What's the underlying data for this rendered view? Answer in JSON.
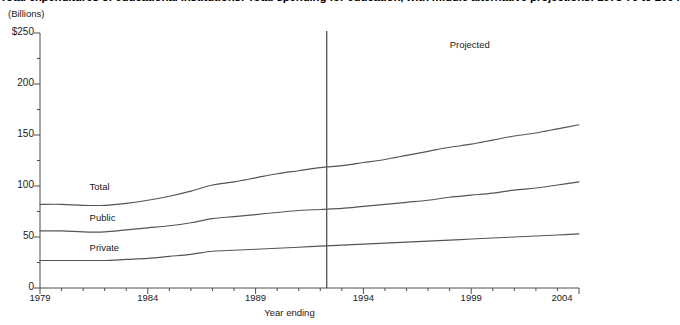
{
  "chart_data": {
    "type": "line",
    "title": "Total expenditures of educational institutions: Total spending for education, with middle alternative projections: 1978-79 to 2004",
    "units_label": "(Billions)",
    "xlabel": "Year ending",
    "ylabel": "",
    "xlim": [
      1979,
      2004
    ],
    "ylim": [
      0,
      250
    ],
    "ytick_labels": [
      "$250",
      "200",
      "150",
      "100",
      "50",
      "0"
    ],
    "ytick_values": [
      250,
      200,
      150,
      100,
      50,
      0
    ],
    "yminor_step": 25,
    "xtick_labels": [
      "1979",
      "1984",
      "1989",
      "1994",
      "1999",
      "2004"
    ],
    "xtick_values": [
      1979,
      1984,
      1989,
      1994,
      1999,
      2004
    ],
    "xminor_step": 1,
    "grid": false,
    "legend_position": "inline-labels",
    "annotations": [
      {
        "text": "Projected",
        "x": 1998,
        "y": 237
      },
      {
        "text": "Total",
        "x": 1981.3,
        "y": 98
      },
      {
        "text": "Public",
        "x": 1981.3,
        "y": 68
      },
      {
        "text": "Private",
        "x": 1981.3,
        "y": 38
      }
    ],
    "projection_divider_year": 1992.3,
    "x": [
      1979,
      1980,
      1981,
      1982,
      1983,
      1984,
      1985,
      1986,
      1987,
      1988,
      1989,
      1990,
      1991,
      1992,
      1993,
      1994,
      1995,
      1996,
      1997,
      1998,
      1999,
      2000,
      2001,
      2002,
      2003,
      2004
    ],
    "series": [
      {
        "name": "Total",
        "color": "#555555",
        "values": [
          82,
          82,
          81,
          81,
          83,
          86,
          90,
          95,
          101,
          104,
          108,
          112,
          115,
          118,
          120,
          123,
          126,
          130,
          134,
          138,
          141,
          145,
          149,
          152,
          156,
          160
        ]
      },
      {
        "name": "Public",
        "color": "#555555",
        "values": [
          56,
          56,
          55,
          55,
          57,
          59,
          61,
          64,
          68,
          70,
          72,
          74,
          76,
          77,
          78,
          80,
          82,
          84,
          86,
          89,
          91,
          93,
          96,
          98,
          101,
          104
        ]
      },
      {
        "name": "Private",
        "color": "#555555",
        "values": [
          27,
          27,
          27,
          27,
          28,
          29,
          31,
          33,
          36,
          37,
          38,
          39,
          40,
          41,
          42,
          43,
          44,
          45,
          46,
          47,
          48,
          49,
          50,
          51,
          52,
          53
        ]
      }
    ]
  },
  "colors": {
    "axis": "#4d4d4d",
    "line": "#555555",
    "divider": "#333333",
    "text": "#1a1a1a"
  }
}
